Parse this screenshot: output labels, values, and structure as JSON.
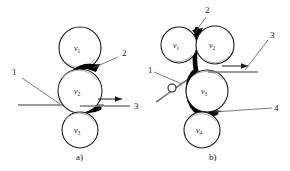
{
  "figure": {
    "background_color": "#ffffff",
    "line_color": "#1a1a1a",
    "strip_color": "#7a7a7a",
    "thick_strip_color": "#000000"
  },
  "panel_a": {
    "caption": "a)",
    "rollers": [
      {
        "id": "va1",
        "label": "v",
        "subscript": "1",
        "cx": 80,
        "cy": 48,
        "r": 21
      },
      {
        "id": "va2",
        "label": "v",
        "subscript": "2",
        "cx": 80,
        "cy": 91,
        "r": 22
      },
      {
        "id": "va3",
        "label": "v",
        "subscript": "3",
        "cx": 80,
        "cy": 130,
        "r": 18
      }
    ],
    "callouts": [
      {
        "id": "a-callout-1",
        "text": "1",
        "x": 12,
        "y": 75
      },
      {
        "id": "a-callout-2",
        "text": "2",
        "x": 122,
        "y": 56
      },
      {
        "id": "a-callout-3",
        "text": "3",
        "x": 134,
        "y": 105
      }
    ]
  },
  "panel_b": {
    "caption": "b)",
    "rollers": [
      {
        "id": "vb1",
        "label": "v",
        "subscript": "1",
        "cx": 179,
        "cy": 45,
        "r": 18
      },
      {
        "id": "vb2",
        "label": "v",
        "subscript": "2",
        "cx": 215,
        "cy": 45,
        "r": 19
      },
      {
        "id": "vb3",
        "label": "v",
        "subscript": "3",
        "cx": 207,
        "cy": 91,
        "r": 21
      },
      {
        "id": "vb4",
        "label": "v",
        "subscript": "4",
        "cx": 202,
        "cy": 130,
        "r": 18
      }
    ],
    "guide_roller": {
      "id": "guide",
      "cx": 172,
      "cy": 88,
      "r": 4
    },
    "callouts": [
      {
        "id": "b-callout-1",
        "text": "1",
        "x": 148,
        "y": 70
      },
      {
        "id": "b-callout-2",
        "text": "2",
        "x": 208,
        "y": 13
      },
      {
        "id": "b-callout-3",
        "text": "3",
        "x": 272,
        "y": 38
      },
      {
        "id": "b-callout-4",
        "text": "4",
        "x": 276,
        "y": 108
      }
    ]
  }
}
